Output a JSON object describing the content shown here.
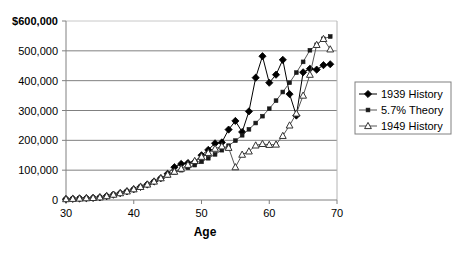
{
  "chart_data": {
    "type": "line",
    "title": "",
    "xlabel": "Age",
    "ylabel": "",
    "xlim": [
      30,
      70
    ],
    "ylim": [
      0,
      600000
    ],
    "grid": true,
    "legend_position": "right",
    "xticks": [
      30,
      40,
      50,
      60,
      70
    ],
    "xtick_labels": [
      "30",
      "40",
      "50",
      "60",
      "70"
    ],
    "yticks": [
      0,
      100000,
      200000,
      300000,
      400000,
      500000,
      600000
    ],
    "ytick_labels": [
      "0",
      "100,000",
      "200,000",
      "300,000",
      "400,000",
      "500,000",
      "$600,000"
    ],
    "x": [
      30,
      31,
      32,
      33,
      34,
      35,
      36,
      37,
      38,
      39,
      40,
      41,
      42,
      43,
      44,
      45,
      46,
      47,
      48,
      49,
      50,
      51,
      52,
      53,
      54,
      55,
      56,
      57,
      58,
      59,
      60,
      61,
      62,
      63,
      64,
      65,
      66,
      67,
      68,
      69
    ],
    "series": [
      {
        "name": "1939 History",
        "marker": "filled-diamond",
        "color": "#000000",
        "values": [
          3000,
          4000,
          5000,
          6000,
          7000,
          9000,
          13000,
          18000,
          23000,
          29000,
          36000,
          44000,
          52000,
          62000,
          73000,
          88000,
          110000,
          121000,
          124000,
          128000,
          150000,
          168000,
          190000,
          193000,
          236000,
          265000,
          228000,
          297000,
          410000,
          482000,
          393000,
          420000,
          470000,
          355000,
          283000,
          428000,
          440000,
          437000,
          452000,
          455000
        ]
      },
      {
        "name": "5.7% Theory",
        "marker": "filled-square",
        "color": "#555555",
        "values": [
          3000,
          4000,
          5000,
          6000,
          7000,
          9000,
          13000,
          18000,
          23000,
          29000,
          36000,
          44000,
          52000,
          62000,
          72000,
          83000,
          92000,
          100000,
          108000,
          117000,
          128000,
          140000,
          153000,
          167000,
          182000,
          199000,
          217000,
          237000,
          258000,
          281000,
          306000,
          333000,
          362000,
          393000,
          427000,
          463000,
          502000,
          520000,
          540000,
          548000
        ]
      },
      {
        "name": "1949 History",
        "marker": "open-triangle",
        "color": "#555555",
        "values": [
          3000,
          4000,
          5000,
          6000,
          7000,
          9000,
          13000,
          18000,
          23000,
          29000,
          36000,
          44000,
          52000,
          62000,
          73000,
          85000,
          95000,
          105000,
          118000,
          131000,
          145000,
          158000,
          172000,
          180000,
          175000,
          110000,
          152000,
          163000,
          183000,
          188000,
          185000,
          186000,
          215000,
          250000,
          290000,
          350000,
          420000,
          520000,
          540000,
          505000
        ]
      }
    ]
  },
  "axis": {
    "x_title": "Age"
  },
  "legend": {
    "entries": [
      {
        "label": "1939 History"
      },
      {
        "label": "5.7% Theory"
      },
      {
        "label": "1949 History"
      }
    ]
  }
}
